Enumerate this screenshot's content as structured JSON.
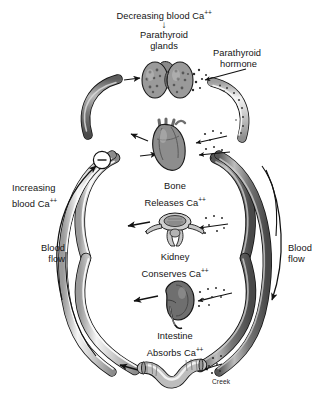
{
  "diagram": {
    "signature": "Creek",
    "feedback_symbol": "–",
    "down_arrow": "↓"
  },
  "labels": {
    "decreasing_ca": "Decreasing blood Ca",
    "decreasing_ca_sup": "++",
    "parathyroid_glands_l1": "Parathyroid",
    "parathyroid_glands_l2": "glands",
    "parathyroid_hormone_l1": "Parathyroid",
    "parathyroid_hormone_l2": "hormone",
    "increasing_ca_l1": "Increasing",
    "increasing_ca_l2": "blood Ca",
    "increasing_ca_sup": "++",
    "blood_flow_left_l1": "Blood",
    "blood_flow_left_l2": "flow",
    "blood_flow_right_l1": "Blood",
    "blood_flow_right_l2": "flow",
    "bone_l1": "Bone",
    "bone_l2": "Releases Ca",
    "bone_sup": "++",
    "kidney_l1": "Kidney",
    "kidney_l2": "Conserves Ca",
    "kidney_sup": "++",
    "intestine_l1": "Intestine",
    "intestine_l2": "Absorbs Ca",
    "intestine_sup": "++"
  },
  "organs": {
    "parathyroid_glands": "parathyroid-glands-illustration",
    "heart": "heart-illustration",
    "vertebra": "vertebra-bone-illustration",
    "kidney": "kidney-illustration",
    "intestine": "intestine-illustration"
  },
  "colors": {
    "vessel_light": "#c9c9c9",
    "vessel_dark": "#6f6f6f",
    "vessel_highlight": "#f2f2f2",
    "outline": "#1a1a1a",
    "text": "#141414"
  }
}
